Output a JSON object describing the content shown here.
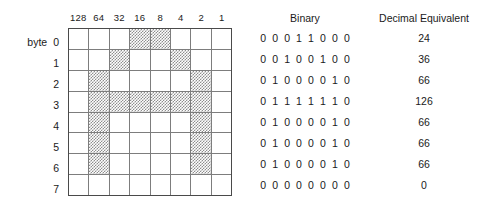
{
  "labels": {
    "byte_word": "byte",
    "binary_header": "Binary",
    "decimal_header": "Decimal Equivalent"
  },
  "bit_weights": [
    "128",
    "64",
    "32",
    "16",
    "8",
    "4",
    "2",
    "1"
  ],
  "colors": {
    "shade": "#8e8e8e",
    "grid_line": "#7d7d7d",
    "grid_border": "#4a4a4a",
    "text": "#1a1a1a",
    "background": "#ffffff"
  },
  "rows": [
    {
      "byte": "0",
      "bits": [
        0,
        0,
        0,
        1,
        1,
        0,
        0,
        0
      ],
      "binary": "0 0 0 1 1 0 0 0",
      "decimal": "24"
    },
    {
      "byte": "1",
      "bits": [
        0,
        0,
        1,
        0,
        0,
        1,
        0,
        0
      ],
      "binary": "0 0 1 0 0 1 0 0",
      "decimal": "36"
    },
    {
      "byte": "2",
      "bits": [
        0,
        1,
        0,
        0,
        0,
        0,
        1,
        0
      ],
      "binary": "0 1 0 0 0 0 1 0",
      "decimal": "66"
    },
    {
      "byte": "3",
      "bits": [
        0,
        1,
        1,
        1,
        1,
        1,
        1,
        0
      ],
      "binary": "0 1 1 1 1 1 1 0",
      "decimal": "126"
    },
    {
      "byte": "4",
      "bits": [
        0,
        1,
        0,
        0,
        0,
        0,
        1,
        0
      ],
      "binary": "0 1 0 0 0 0 1 0",
      "decimal": "66"
    },
    {
      "byte": "5",
      "bits": [
        0,
        1,
        0,
        0,
        0,
        0,
        1,
        0
      ],
      "binary": "0 1 0 0 0 0 1 0",
      "decimal": "66"
    },
    {
      "byte": "6",
      "bits": [
        0,
        1,
        0,
        0,
        0,
        0,
        1,
        0
      ],
      "binary": "0 1 0 0 0 0 1 0",
      "decimal": "66"
    },
    {
      "byte": "7",
      "bits": [
        0,
        0,
        0,
        0,
        0,
        0,
        0,
        0
      ],
      "binary": "0 0 0 0 0 0 0 0",
      "decimal": "0"
    }
  ]
}
